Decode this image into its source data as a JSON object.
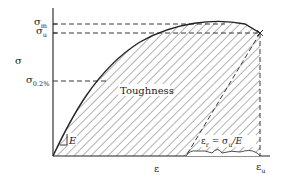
{
  "diagram": {
    "y_axis": {
      "label": "σ",
      "ticks": [
        {
          "symbol": "σ",
          "subscript": "m",
          "y": 24
        },
        {
          "symbol": "σ",
          "subscript": "u",
          "y": 33
        },
        {
          "symbol": "σ",
          "subscript": "0.2%",
          "y": 81
        }
      ]
    },
    "x_axis": {
      "label": "ε",
      "ticks": [
        {
          "symbol": "ε",
          "subscript": "u"
        }
      ]
    },
    "region_label": "Toughness",
    "modulus_label": "E",
    "annotation": {
      "lhs_symbol": "ε",
      "lhs_subscript": "r",
      "equals": " = ",
      "rhs_symbol": "σ",
      "rhs_subscript": "u",
      "rhs_tail": "/E"
    },
    "colors": {
      "line": "#222222",
      "hatch": "#555555",
      "background": "#ffffff"
    }
  }
}
